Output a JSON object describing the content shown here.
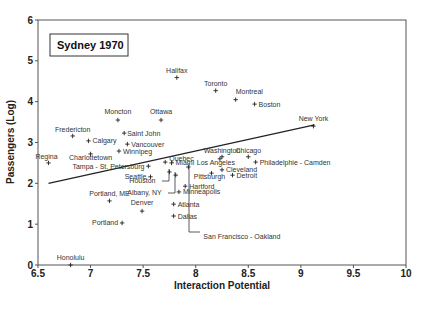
{
  "chart_data": {
    "type": "scatter",
    "title": "Sydney 1970",
    "xlabel": "Interaction Potential",
    "ylabel": "Passengers (Log)",
    "xlim": [
      6.5,
      10
    ],
    "ylim": [
      0,
      6
    ],
    "xticks": [
      "6.5",
      "7",
      "7.5",
      "8",
      "8.5",
      "9",
      "9.5",
      "10"
    ],
    "yticks": [
      "0",
      "1",
      "2",
      "3",
      "4",
      "5",
      "6"
    ],
    "grid": false,
    "legend": "none",
    "points": [
      {
        "label": "Halifax",
        "x": 7.82,
        "y": 4.59
      },
      {
        "label": "Toronto",
        "x": 8.19,
        "y": 4.27
      },
      {
        "label": "Montreal",
        "x": 8.38,
        "y": 4.05
      },
      {
        "label": "Boston",
        "x": 8.56,
        "y": 3.94
      },
      {
        "label": "New York",
        "x": 9.12,
        "y": 3.4
      },
      {
        "label": "Moncton",
        "x": 7.26,
        "y": 3.55
      },
      {
        "label": "Ottawa",
        "x": 7.67,
        "y": 3.55
      },
      {
        "label": "Fredericton",
        "x": 6.83,
        "y": 3.16
      },
      {
        "label": "Saint John",
        "x": 7.32,
        "y": 3.23
      },
      {
        "label": "Calgary",
        "x": 6.98,
        "y": 3.04
      },
      {
        "label": "Vancouver",
        "x": 7.35,
        "y": 2.96
      },
      {
        "label": "Winnipeg",
        "x": 7.27,
        "y": 2.79
      },
      {
        "label": "Charlottetown",
        "x": 7.0,
        "y": 2.72
      },
      {
        "label": "Regina",
        "x": 6.6,
        "y": 2.5
      },
      {
        "label": "Quebec",
        "x": 7.71,
        "y": 2.52
      },
      {
        "label": "Miami",
        "x": 7.77,
        "y": 2.5
      },
      {
        "label": "Tampa - St. Petersburg",
        "x": 7.55,
        "y": 2.42
      },
      {
        "label": "Seattle",
        "x": 7.57,
        "y": 2.16
      },
      {
        "label": "Houston",
        "x": 7.75,
        "y": 2.28
      },
      {
        "label": "Albany, NY",
        "x": 7.81,
        "y": 2.2
      },
      {
        "label": "Portland, ME",
        "x": 7.18,
        "y": 1.57
      },
      {
        "label": "Denver",
        "x": 7.49,
        "y": 1.32
      },
      {
        "label": "Portland",
        "x": 7.3,
        "y": 1.03
      },
      {
        "label": "Atlanta",
        "x": 7.79,
        "y": 1.49
      },
      {
        "label": "Dallas",
        "x": 7.79,
        "y": 1.2
      },
      {
        "label": "Hartford",
        "x": 7.9,
        "y": 1.93
      },
      {
        "label": "Minneapolis",
        "x": 7.84,
        "y": 1.79
      },
      {
        "label": "San Francisco - Oakland",
        "x": 7.93,
        "y": 2.4
      },
      {
        "label": "Washington",
        "x": 8.25,
        "y": 2.65
      },
      {
        "label": "Chicago",
        "x": 8.5,
        "y": 2.65
      },
      {
        "label": "Los Angeles",
        "x": 8.23,
        "y": 2.6
      },
      {
        "label": "Philadelphie - Camden",
        "x": 8.57,
        "y": 2.52
      },
      {
        "label": "Cleveland",
        "x": 8.25,
        "y": 2.33
      },
      {
        "label": "Pittsburgh",
        "x": 8.15,
        "y": 2.25
      },
      {
        "label": "Detroit",
        "x": 8.35,
        "y": 2.2
      },
      {
        "label": "Honolulu",
        "x": 6.81,
        "y": 0.0
      }
    ],
    "regression_line": {
      "x": [
        6.6,
        9.13
      ],
      "y": [
        2.0,
        3.43
      ]
    }
  }
}
